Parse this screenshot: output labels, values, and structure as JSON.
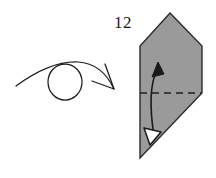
{
  "diagram": {
    "kind": "origami-fold-instruction",
    "step_label": "12",
    "colors": {
      "paper_fill": "#9a9a9a",
      "paper_stroke": "#2b2b2b",
      "crease_line": "#1f1f1f",
      "arrow_stroke": "#1a1a1a",
      "arrowhead_open_fill": "#ffffff",
      "background": "#ffffff",
      "label_text": "#1a1a1a"
    },
    "symbols": {
      "turn_over": {
        "name": "turn-over-symbol",
        "description": "circle with curved arrow arcing over it",
        "circle": {
          "cx": 65,
          "cy": 82,
          "rx": 17,
          "ry": 18
        },
        "arc_tail": {
          "x": 16,
          "y": 86
        },
        "arc_head": {
          "x": 114,
          "y": 89
        }
      }
    },
    "shape": {
      "name": "folded-paper-polygon",
      "points": "170,13 202,46 202,93 140,158 140,46",
      "vertices": [
        {
          "label": "apex",
          "x": 170,
          "y": 13
        },
        {
          "label": "right-shoulder",
          "x": 202,
          "y": 46
        },
        {
          "label": "right-crease-end",
          "x": 202,
          "y": 93
        },
        {
          "label": "bottom-point",
          "x": 140,
          "y": 158
        },
        {
          "label": "left-shoulder",
          "x": 140,
          "y": 46
        }
      ]
    },
    "crease": {
      "name": "valley-fold-crease",
      "style": "dashed",
      "x1": 140,
      "y1": 93,
      "x2": 202,
      "y2": 93,
      "dash_pattern": "7,5"
    },
    "fold_arrow": {
      "name": "double-headed-fold-arrow",
      "path": "M 156,69 C 148,86 152,118 155,137",
      "head_top": {
        "x": 156,
        "y": 66,
        "style": "solid"
      },
      "head_bottom": {
        "x": 155,
        "y": 141,
        "style": "open"
      }
    }
  }
}
